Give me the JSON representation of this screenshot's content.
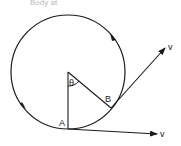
{
  "caption_fragment": "Body at",
  "diagram": {
    "type": "circular-motion",
    "labels": {
      "theta": "θ",
      "point_a": "A",
      "point_b": "B",
      "velocity_a": "v",
      "velocity_b": "v"
    },
    "colors": {
      "stroke": "#1a1a1a",
      "background": "#ffffff"
    }
  }
}
